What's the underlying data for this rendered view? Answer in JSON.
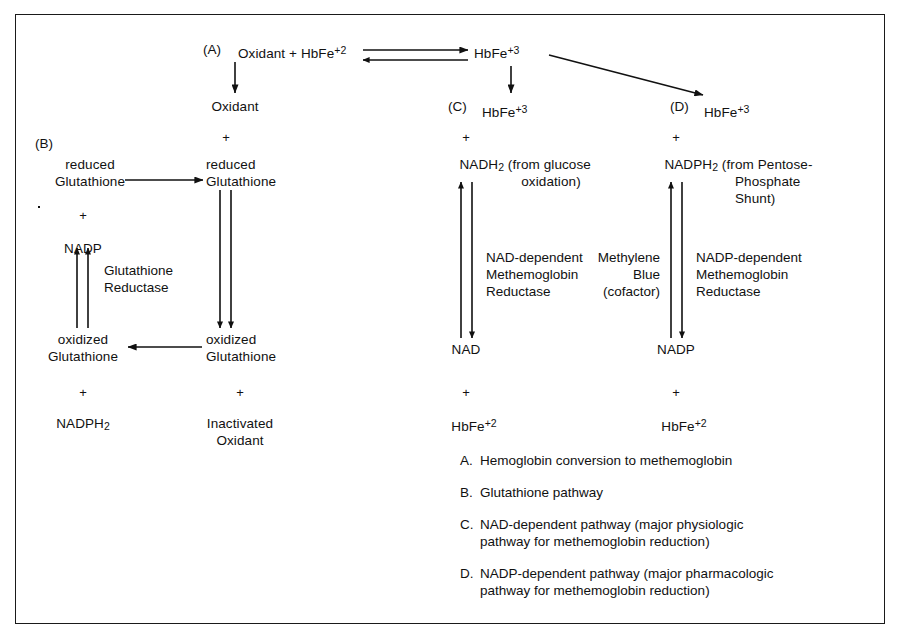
{
  "figure": {
    "border_color": "#1a1a1a",
    "background": "#ffffff",
    "text_color": "#111111"
  },
  "top_row": {
    "section_a_tag": "(A)",
    "reactants": "Oxidant + HbFe",
    "reactants_charge": "+2",
    "product": "HbFe",
    "product_charge": "+3"
  },
  "branch_labels": {
    "oxidant": "Oxidant",
    "c_tag": "(C)",
    "c_species": "HbFe",
    "c_charge": "+3",
    "d_tag": "(D)",
    "d_species": "HbFe",
    "d_charge": "+3"
  },
  "glutathione_pathway": {
    "b_tag": "(B)",
    "left": {
      "reduced_line1": "reduced",
      "reduced_line2": "Glutathione",
      "plus_1": "+",
      "nadp": "NADP",
      "enzyme_line1": "Glutathione",
      "enzyme_line2": "Reductase",
      "oxidized_line1": "oxidized",
      "oxidized_line2": "Glutathione",
      "plus_2": "+",
      "nadph2_text": "NADPH",
      "nadph2_sub": "2"
    },
    "right": {
      "plus_top": "+",
      "reduced_line1": "reduced",
      "reduced_line2": "Glutathione",
      "oxidized_line1": "oxidized",
      "oxidized_line2": "Glutathione",
      "plus_bottom": "+",
      "product_line1": "Inactivated",
      "product_line2": "Oxidant"
    }
  },
  "nad_pathway": {
    "plus_top": "+",
    "donor_text": "NADH",
    "donor_sub": "2",
    "donor_note_line1": " (from glucose",
    "donor_note_line2": "oxidation)",
    "enzyme_line1": "NAD-dependent",
    "enzyme_line2": "Methemoglobin",
    "enzyme_line3": "Reductase",
    "acceptor": "NAD",
    "plus_bottom": "+",
    "product": "HbFe",
    "product_charge": "+2"
  },
  "nadp_pathway": {
    "plus_top": "+",
    "donor_text": "NADPH",
    "donor_sub": "2",
    "donor_note_line1": " (from Pentose-",
    "donor_note_line2": "Phosphate",
    "donor_note_line3": "Shunt)",
    "cofactor_line1": "Methylene",
    "cofactor_line2": "Blue",
    "cofactor_line3": "(cofactor)",
    "enzyme_line1": "NADP-dependent",
    "enzyme_line2": "Methemoglobin",
    "enzyme_line3": "Reductase",
    "acceptor": "NADP",
    "plus_bottom": "+",
    "product": "HbFe",
    "product_charge": "+2"
  },
  "legend": {
    "items": [
      {
        "key": "A.",
        "text": "Hemoglobin conversion to methemoglobin"
      },
      {
        "key": "B.",
        "text": "Glutathione pathway"
      },
      {
        "key": "C.",
        "text": "NAD-dependent pathway (major physiologic\npathway for methemoglobin reduction)"
      },
      {
        "key": "D.",
        "text": "NADP-dependent pathway (major pharmacologic\npathway for methemoglobin reduction)"
      }
    ]
  }
}
